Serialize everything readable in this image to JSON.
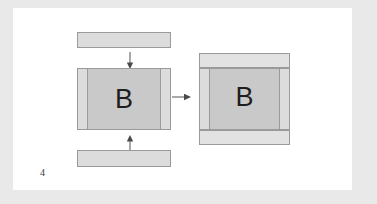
{
  "figure": {
    "number": "4",
    "page_background": "#ffffff",
    "canvas_background": "#e9e9e9",
    "line_color": "#9a9a9a",
    "fill_light": "#dcdcdc",
    "fill_mid": "#c9c9c9",
    "fill_pale": "#e2e2e2",
    "label_color": "#1e1e1e"
  },
  "left_assembly": {
    "center_block": {
      "label": "B",
      "fill": "#c9c9c9"
    },
    "left_side_panel": {
      "fill": "#dcdcdc"
    },
    "right_side_panel": {
      "fill": "#dcdcdc"
    },
    "top_bar": {
      "fill": "#dcdcdc"
    },
    "bottom_bar": {
      "fill": "#dcdcdc"
    }
  },
  "right_assembly": {
    "center_block": {
      "label": "B",
      "fill": "#c9c9c9"
    },
    "left_side_panel": {
      "fill": "#dcdcdc"
    },
    "right_side_panel": {
      "fill": "#dcdcdc"
    },
    "top_bar": {
      "fill": "#e2e2e2"
    },
    "bottom_bar": {
      "fill": "#e2e2e2"
    }
  },
  "arrows": {
    "top_down": {
      "direction": "down"
    },
    "bottom_up": {
      "direction": "up"
    },
    "transform_right": {
      "direction": "right"
    }
  }
}
